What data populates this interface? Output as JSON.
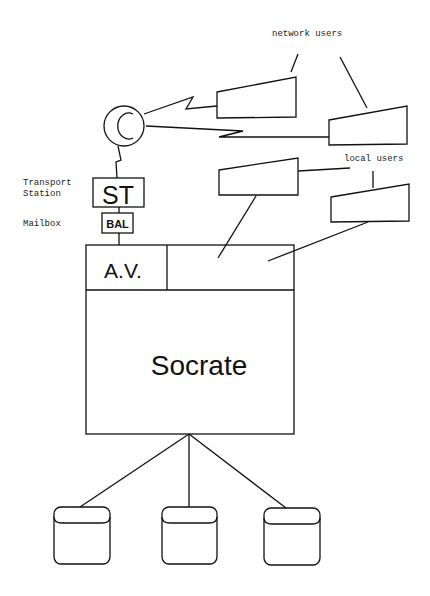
{
  "labels": {
    "network_users": "network users",
    "local_users": "local users",
    "transport_station": [
      "Transport",
      "Station"
    ],
    "mailbox": "Mailbox"
  },
  "nodes": {
    "concentrator": "C",
    "st": "ST",
    "bal": "BAL",
    "av": "A.V.",
    "socrate": "Socrate"
  },
  "colors": {
    "stroke": "#111111",
    "background": "#ffffff"
  }
}
